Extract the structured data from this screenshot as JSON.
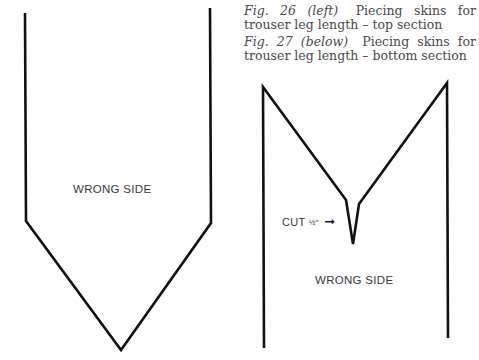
{
  "captions": [
    {
      "fig": "Fig. 26",
      "position": "(left)",
      "text": "Piecing skins for trouser leg length – top section"
    },
    {
      "fig": "Fig. 27",
      "position": "(below)",
      "text": "Piecing skins for trouser leg length – bottom section"
    }
  ],
  "figure_left": {
    "label": "WRONG SIDE"
  },
  "figure_right": {
    "label": "WRONG SIDE",
    "cut_label": "CUT",
    "cut_fraction": "½″",
    "cut_arrow": "➞"
  },
  "colors": {
    "line": "#111111",
    "text": "#3a3a3a",
    "caption": "#4a4a4a"
  }
}
